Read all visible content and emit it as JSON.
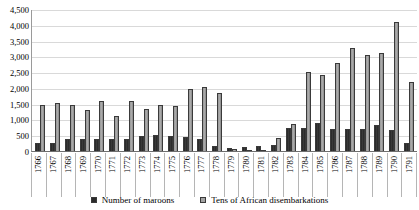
{
  "chart_data": {
    "type": "bar",
    "title": "",
    "subtitle": "",
    "xlabel": "",
    "ylabel": "",
    "ylim": [
      0,
      4500
    ],
    "ytick_interval": 500,
    "grid": true,
    "legend_position": "bottom",
    "categories": [
      "1766",
      "1767",
      "1768",
      "1769",
      "1770",
      "1771",
      "1772",
      "1773",
      "1774",
      "1775",
      "1776",
      "1777",
      "1778",
      "1779",
      "1780",
      "1781",
      "1782",
      "1783",
      "1784",
      "1785",
      "1786",
      "1787",
      "1788",
      "1789",
      "1790",
      "1791"
    ],
    "ytick_labels": [
      "4,500",
      "4,000",
      "3,500",
      "3,000",
      "2,500",
      "2,000",
      "1,500",
      "1,000",
      "500",
      "0"
    ],
    "ytick_values": [
      4500,
      4000,
      3500,
      3000,
      2500,
      2000,
      1500,
      1000,
      500,
      0
    ],
    "series": [
      {
        "name": "Number of maroons",
        "color": "#2b2b2b",
        "values": [
          260,
          250,
          370,
          380,
          370,
          370,
          390,
          470,
          510,
          480,
          430,
          380,
          160,
          100,
          120,
          160,
          200,
          720,
          740,
          880,
          700,
          700,
          710,
          830,
          680,
          240
        ]
      },
      {
        "name": "Tens of African disembarkations",
        "color": "#a3a3a3",
        "values": [
          1470,
          1510,
          1450,
          1290,
          1580,
          1100,
          1570,
          1330,
          1460,
          1430,
          1960,
          2030,
          1850,
          60,
          30,
          40,
          400,
          850,
          2500,
          2400,
          2800,
          3250,
          3050,
          3100,
          4100,
          2200
        ]
      }
    ]
  },
  "legend": {
    "items": [
      {
        "label": "Number of maroons",
        "swatch_class": "maroons"
      },
      {
        "label": "Tens of African disembarkations",
        "swatch_class": "disemb"
      }
    ]
  }
}
